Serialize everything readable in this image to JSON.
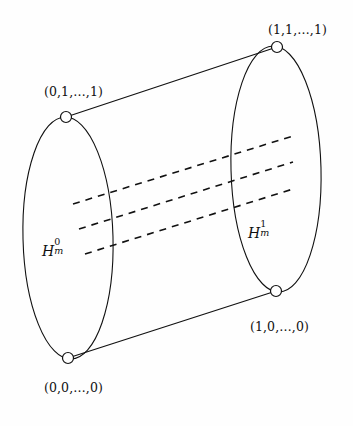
{
  "figure": {
    "type": "diagram",
    "background_color": "#fefefe",
    "stroke_color": "#111111",
    "vertices": [
      {
        "id": "top-right",
        "label": "(1,1,…,1)",
        "x": 277,
        "y": 47,
        "radius": 5.5
      },
      {
        "id": "top-left",
        "label": "(0,1,…,1)",
        "x": 66,
        "y": 117,
        "radius": 5.5
      },
      {
        "id": "bottom-right",
        "label": "(1,0,…,0)",
        "x": 276,
        "y": 291,
        "radius": 5.5
      },
      {
        "id": "bottom-left",
        "label": "(0,0,…,0)",
        "x": 68,
        "y": 358,
        "radius": 5.5
      }
    ],
    "labels": {
      "top_right_vertex": "(1,1,…,1)",
      "top_left_vertex": "(0,1,…,1)",
      "bottom_right_vertex": "(1,0,…,0)",
      "bottom_left_vertex": "(0,0,…,0)",
      "left_face": {
        "base": "H",
        "superscript": "0",
        "subscript": "m"
      },
      "right_face": {
        "base": "H",
        "superscript": "1",
        "subscript": "m"
      }
    },
    "ellipses": [
      {
        "id": "left-face",
        "cx": 68,
        "cy": 238,
        "rx": 45,
        "ry": 121,
        "rotation": -1.5
      },
      {
        "id": "right-face",
        "cx": 276,
        "cy": 169,
        "rx": 45,
        "ry": 123,
        "rotation": -1.5
      }
    ],
    "edges": [
      {
        "id": "top-edge",
        "x1": 66,
        "y1": 117,
        "x2": 277,
        "y2": 47,
        "style": "solid"
      },
      {
        "id": "bottom-edge",
        "x1": 68,
        "y1": 358,
        "x2": 276,
        "y2": 291,
        "style": "solid"
      }
    ],
    "dashed_lines": [
      {
        "id": "dashed-line-1",
        "x1": 73,
        "y1": 204,
        "x2": 293,
        "y2": 136
      },
      {
        "id": "dashed-line-2",
        "x1": 79,
        "y1": 229,
        "x2": 293,
        "y2": 162
      },
      {
        "id": "dashed-line-3",
        "x1": 85,
        "y1": 254,
        "x2": 293,
        "y2": 189
      }
    ]
  }
}
